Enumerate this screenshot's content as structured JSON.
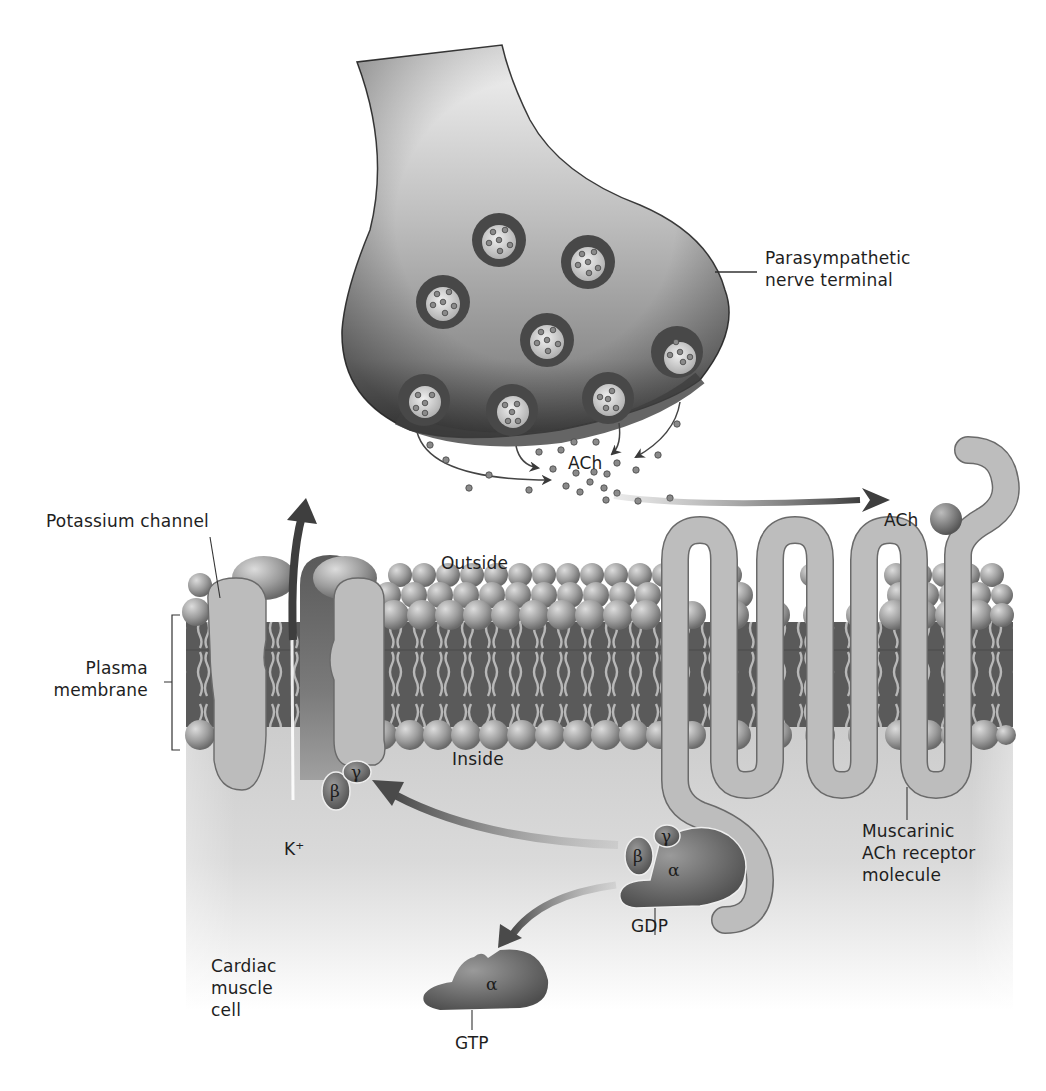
{
  "figure": {
    "labels": {
      "nerve_terminal": [
        "Parasympathetic",
        "nerve terminal"
      ],
      "ach_release": "ACh",
      "ach_bound": "ACh",
      "potassium_channel": "Potassium channel",
      "outside": "Outside",
      "inside": "Inside",
      "plasma_membrane": [
        "Plasma",
        "membrane"
      ],
      "potassium_ion": "K⁺",
      "receptor": [
        "Muscarinic",
        "ACh receptor",
        "molecule"
      ],
      "gdp": "GDP",
      "gtp": "GTP",
      "cell": [
        "Cardiac",
        "muscle",
        "cell"
      ]
    },
    "g_protein_subunits": {
      "alpha": "α",
      "beta": "β",
      "gamma": "γ"
    },
    "colors": {
      "background": "#ffffff",
      "terminal_light": "#e2e2e2",
      "terminal_dark": "#5a5a5a",
      "vesicle_ring": "#4a4a4a",
      "membrane_head": "#9a9a9a",
      "membrane_core": "#585858",
      "protein": "#b7b7b7",
      "g_protein": "#6e6e6e",
      "cytoplasm": "#c8c8c8",
      "arrow": "#4d4d4d",
      "text": "#1e1e1e"
    }
  }
}
